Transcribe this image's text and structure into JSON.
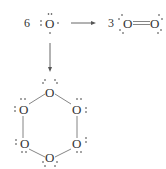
{
  "diagram": {
    "reactant": {
      "coefficient": "6",
      "atom": "O"
    },
    "product_right": {
      "coefficient": "3",
      "atoms": [
        "O",
        "O"
      ],
      "bond": "double"
    },
    "product_down": {
      "ring_atoms": [
        "O",
        "O",
        "O",
        "O",
        "O",
        "O"
      ],
      "ring": "hexagonal O6, single bonds"
    },
    "arrows": [
      "right",
      "down"
    ],
    "colors": {
      "ink": "#333333",
      "bond": "#666666",
      "background": "#ffffff"
    }
  }
}
